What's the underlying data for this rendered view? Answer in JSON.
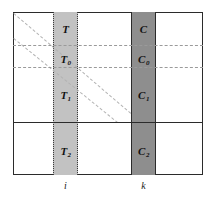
{
  "figure": {
    "background_color": "#ffffff",
    "frame_color": "#2b2b2b",
    "column_t_color": "#c2c2c2",
    "column_c_color": "#8e8e8e",
    "dashed_guide_color": "#9a9a9a",
    "diagonal_guide_color": "#b3b3b3"
  },
  "columns": {
    "t_column": {
      "axis_label": "i",
      "cells": [
        {
          "id": "t-top",
          "label": "T",
          "subscript": ""
        },
        {
          "id": "t-zero",
          "label": "T",
          "subscript": "0"
        },
        {
          "id": "t-one",
          "label": "T",
          "subscript": "1"
        },
        {
          "id": "t-two",
          "label": "T",
          "subscript": "2"
        }
      ]
    },
    "c_column": {
      "axis_label": "k",
      "cells": [
        {
          "id": "c-top",
          "label": "C",
          "subscript": ""
        },
        {
          "id": "c-zero",
          "label": "C",
          "subscript": "0"
        },
        {
          "id": "c-one",
          "label": "C",
          "subscript": "1"
        },
        {
          "id": "c-two",
          "label": "C",
          "subscript": "2"
        }
      ]
    }
  }
}
